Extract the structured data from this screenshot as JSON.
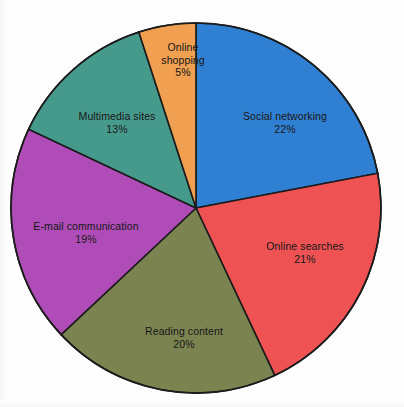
{
  "page": {
    "scan_header_fragment": "· · · · · ·",
    "background_color": "#fdfdfd"
  },
  "chart_data": {
    "type": "pie",
    "title": "",
    "subtitle": "",
    "xlabel": "",
    "ylabel": "",
    "legend_position": "none",
    "grid": false,
    "labels_inside_slices": true,
    "start_angle_deg": 0,
    "direction": "clockwise",
    "total_percent": 100,
    "value_unit": "%",
    "categories": [
      "Social networking",
      "Online searches",
      "Reading content",
      "E-mail communication",
      "Multimedia sites",
      "Online shopping"
    ],
    "values": [
      22,
      21,
      20,
      19,
      13,
      5
    ],
    "colors": [
      "#2f80d2",
      "#ee5253",
      "#7b8450",
      "#b04cb8",
      "#469a8c",
      "#f0a050"
    ],
    "slices": [
      {
        "label": "Social networking",
        "value": 22,
        "value_text": "22%",
        "color": "#2f80d2",
        "start_angle_deg": 0.0,
        "end_angle_deg": 79.2,
        "label_x": 285,
        "label_y": 122,
        "multiline": false
      },
      {
        "label": "Online searches",
        "value": 21,
        "value_text": "21%",
        "color": "#ee5253",
        "start_angle_deg": 79.2,
        "end_angle_deg": 154.8,
        "label_x": 305,
        "label_y": 252,
        "multiline": false
      },
      {
        "label": "Reading content",
        "value": 20,
        "value_text": "20%",
        "color": "#7b8450",
        "start_angle_deg": 154.8,
        "end_angle_deg": 226.8,
        "label_x": 184,
        "label_y": 337,
        "multiline": false
      },
      {
        "label": "E-mail communication",
        "value": 19,
        "value_text": "19%",
        "color": "#b04cb8",
        "start_angle_deg": 226.8,
        "end_angle_deg": 295.2,
        "label_x": 86,
        "label_y": 232,
        "multiline": false
      },
      {
        "label": "Multimedia sites",
        "value": 13,
        "value_text": "13%",
        "color": "#469a8c",
        "start_angle_deg": 295.2,
        "end_angle_deg": 342.0,
        "label_x": 117,
        "label_y": 122,
        "multiline": false
      },
      {
        "label": "Online shopping",
        "value": 5,
        "value_text": "5%",
        "color": "#f0a050",
        "start_angle_deg": 342.0,
        "end_angle_deg": 360.0,
        "label_x": 183,
        "label_y": 60,
        "multiline": true
      }
    ],
    "geometry": {
      "center_x": 196,
      "center_y": 208,
      "radius": 185,
      "outline_color": "#1b1b1b",
      "outline_width": 1.6
    }
  }
}
